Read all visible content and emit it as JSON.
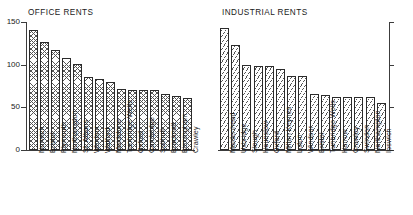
{
  "chart_data": [
    {
      "type": "bar",
      "title": "OFFICE RENTS",
      "xlabel": "",
      "ylabel": "",
      "ylim": [
        0,
        150
      ],
      "yticks": [
        0,
        50,
        100,
        150
      ],
      "grid": false,
      "legend": "none",
      "categories": [
        "Norwich",
        "Bristol",
        "Plymouth",
        "Northampton",
        "St. Albans",
        "Windsor",
        "Watford",
        "Maidstone",
        "Tunbridge Wells",
        "Oxford",
        "Cambridge",
        "Solihull",
        "Bracknell",
        "Birmingham",
        "Crawley"
      ],
      "values": [
        141,
        126,
        117,
        108,
        101,
        86,
        83,
        80,
        72,
        70,
        70,
        70,
        66,
        63,
        61
      ]
    },
    {
      "type": "bar",
      "title": "INDUSTRIAL RENTS",
      "xlabel": "",
      "ylabel": "",
      "ylim": [
        0,
        150
      ],
      "yticks": [
        0,
        50,
        100,
        150
      ],
      "grid": false,
      "legend": "none",
      "categories": [
        "Maidenhead",
        "Uxbridge",
        "Slough",
        "Hounslow",
        "Oxford",
        "Milton Keynes",
        "Luton",
        "Windsor",
        "Bristol",
        "Tunbridge Wells",
        "Harrow",
        "Crawley",
        "Swindon",
        "Northampton",
        "Ipswich"
      ],
      "values": [
        143,
        123,
        100,
        99,
        99,
        95,
        87,
        87,
        66,
        65,
        62,
        62,
        62,
        62,
        55
      ]
    }
  ],
  "axis": {
    "tick_150": "150",
    "tick_100": "100",
    "tick_50": "50",
    "tick_0": "0"
  },
  "titles": {
    "office": "OFFICE RENTS",
    "industrial": "INDUSTRIAL RENTS"
  },
  "colors": {
    "ink": "#1a1a1a",
    "axis": "#3c3c3c",
    "hatch": "#555555",
    "background": "#ffffff"
  }
}
